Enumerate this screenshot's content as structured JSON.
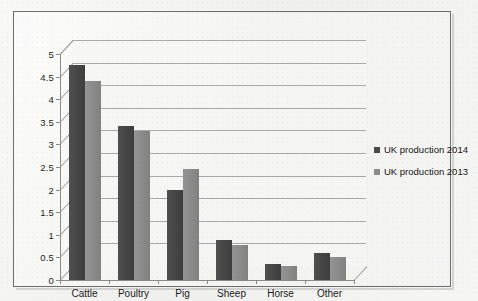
{
  "chart_data": {
    "type": "bar",
    "title": "",
    "xlabel": "",
    "ylabel": "",
    "categories": [
      "Cattle",
      "Poultry",
      "Pig",
      "Sheep",
      "Horse",
      "Other"
    ],
    "series": [
      {
        "name": "UK production 2014",
        "color": "#4a4a4a",
        "values": [
          4.75,
          3.4,
          2.0,
          0.88,
          0.35,
          0.6
        ]
      },
      {
        "name": "UK production 2013",
        "color": "#8c8c8c",
        "values": [
          4.4,
          3.3,
          2.45,
          0.78,
          0.3,
          0.5
        ]
      }
    ],
    "ylim": [
      0,
      5
    ],
    "ytick_labels": [
      "0",
      "0.5",
      "1",
      "1.5",
      "2",
      "2.5",
      "3",
      "3.5",
      "4",
      "4.5",
      "5"
    ],
    "ytick_values": [
      0,
      0.5,
      1,
      1.5,
      2,
      2.5,
      3,
      3.5,
      4,
      4.5,
      5
    ],
    "grid": true,
    "legend_position": "right",
    "style": "3d-clustered-column",
    "plot_background": "#f6f6f4",
    "gridline_color": "#a9a9a9",
    "border_color": "#6e6e6e"
  },
  "legend": {
    "items": [
      {
        "label": "UK production 2014"
      },
      {
        "label": "UK production 2013"
      }
    ]
  }
}
